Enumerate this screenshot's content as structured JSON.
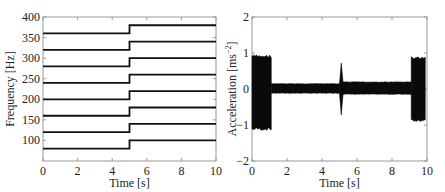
{
  "chart_data": [
    {
      "type": "line",
      "title": "",
      "xlabel": "Time [s]",
      "ylabel": "Frequency [Hz]",
      "xlim": [
        0,
        10
      ],
      "ylim": [
        50,
        400
      ],
      "xticks": [
        "0",
        "2",
        "4",
        "6",
        "8",
        "10"
      ],
      "yticks": [
        "100",
        "150",
        "200",
        "250",
        "300",
        "350",
        "400"
      ],
      "grid": false,
      "step_time": 5,
      "series": [
        {
          "name": "f1",
          "x": [
            0,
            5,
            5,
            10
          ],
          "values": [
            80,
            80,
            100,
            100
          ]
        },
        {
          "name": "f2",
          "x": [
            0,
            5,
            5,
            10
          ],
          "values": [
            120,
            120,
            140,
            140
          ]
        },
        {
          "name": "f3",
          "x": [
            0,
            5,
            5,
            10
          ],
          "values": [
            160,
            160,
            180,
            180
          ]
        },
        {
          "name": "f4",
          "x": [
            0,
            5,
            5,
            10
          ],
          "values": [
            200,
            200,
            220,
            220
          ]
        },
        {
          "name": "f5",
          "x": [
            0,
            5,
            5,
            10
          ],
          "values": [
            240,
            240,
            260,
            260
          ]
        },
        {
          "name": "f6",
          "x": [
            0,
            5,
            5,
            10
          ],
          "values": [
            280,
            280,
            300,
            300
          ]
        },
        {
          "name": "f7",
          "x": [
            0,
            5,
            5,
            10
          ],
          "values": [
            320,
            320,
            340,
            340
          ]
        },
        {
          "name": "f8",
          "x": [
            0,
            5,
            5,
            10
          ],
          "values": [
            360,
            360,
            380,
            380
          ]
        }
      ]
    },
    {
      "type": "line",
      "title": "",
      "xlabel": "Time [s]",
      "ylabel": "Acceleration [ms^-2]",
      "xlim": [
        0,
        10
      ],
      "ylim": [
        -2,
        2
      ],
      "xticks": [
        "0",
        "2",
        "4",
        "6",
        "8",
        "10"
      ],
      "yticks": [
        "-2",
        "-1",
        "0",
        "1",
        "2"
      ],
      "grid": false,
      "envelope_segments": [
        {
          "t_start": 0.0,
          "t_end": 1.1,
          "upper": 0.95,
          "lower": -1.15
        },
        {
          "t_start": 1.1,
          "t_end": 5.0,
          "upper": 0.15,
          "lower": -0.12
        },
        {
          "t_start": 5.0,
          "t_end": 5.2,
          "upper": 0.72,
          "lower": -0.72
        },
        {
          "t_start": 5.2,
          "t_end": 9.1,
          "upper": 0.2,
          "lower": -0.15
        },
        {
          "t_start": 9.1,
          "t_end": 9.9,
          "upper": 0.9,
          "lower": -0.9
        }
      ]
    }
  ]
}
